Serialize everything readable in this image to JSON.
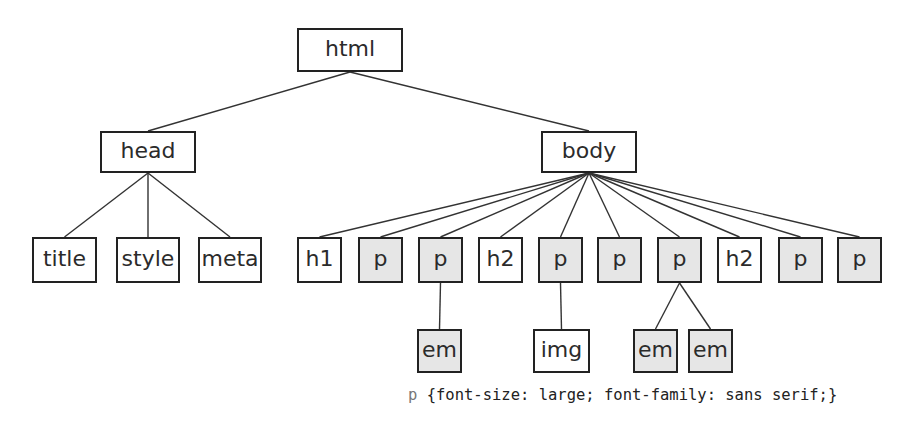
{
  "diagram": {
    "type": "dom-tree",
    "colors": {
      "border": "#222222",
      "edge": "#333333",
      "styled_fill": "#e6e6e6",
      "plain_fill": "#ffffff",
      "text": "#2b2b2b"
    },
    "nodes": [
      {
        "id": "html",
        "label": "html",
        "parent": null,
        "styled": false,
        "x": 297,
        "y": 28,
        "w": 106,
        "h": 44
      },
      {
        "id": "head",
        "label": "head",
        "parent": "html",
        "styled": false,
        "x": 100,
        "y": 131,
        "w": 96,
        "h": 42
      },
      {
        "id": "body",
        "label": "body",
        "parent": "html",
        "styled": false,
        "x": 541,
        "y": 131,
        "w": 96,
        "h": 42
      },
      {
        "id": "title",
        "label": "title",
        "parent": "head",
        "styled": false,
        "x": 32,
        "y": 237,
        "w": 65,
        "h": 46
      },
      {
        "id": "style",
        "label": "style",
        "parent": "head",
        "styled": false,
        "x": 116,
        "y": 237,
        "w": 64,
        "h": 46
      },
      {
        "id": "meta",
        "label": "meta",
        "parent": "head",
        "styled": false,
        "x": 198,
        "y": 237,
        "w": 64,
        "h": 46
      },
      {
        "id": "h1",
        "label": "h1",
        "parent": "body",
        "styled": false,
        "x": 297,
        "y": 237,
        "w": 45,
        "h": 46
      },
      {
        "id": "p1",
        "label": "p",
        "parent": "body",
        "styled": true,
        "x": 358,
        "y": 237,
        "w": 45,
        "h": 46
      },
      {
        "id": "p2",
        "label": "p",
        "parent": "body",
        "styled": true,
        "x": 418,
        "y": 237,
        "w": 45,
        "h": 46
      },
      {
        "id": "h2a",
        "label": "h2",
        "parent": "body",
        "styled": false,
        "x": 478,
        "y": 237,
        "w": 45,
        "h": 46
      },
      {
        "id": "p3",
        "label": "p",
        "parent": "body",
        "styled": true,
        "x": 538,
        "y": 237,
        "w": 45,
        "h": 46
      },
      {
        "id": "p4",
        "label": "p",
        "parent": "body",
        "styled": true,
        "x": 597,
        "y": 237,
        "w": 45,
        "h": 46
      },
      {
        "id": "p5",
        "label": "p",
        "parent": "body",
        "styled": true,
        "x": 657,
        "y": 237,
        "w": 45,
        "h": 46
      },
      {
        "id": "h2b",
        "label": "h2",
        "parent": "body",
        "styled": false,
        "x": 717,
        "y": 237,
        "w": 45,
        "h": 46
      },
      {
        "id": "p6",
        "label": "p",
        "parent": "body",
        "styled": true,
        "x": 778,
        "y": 237,
        "w": 45,
        "h": 46
      },
      {
        "id": "p7",
        "label": "p",
        "parent": "body",
        "styled": true,
        "x": 837,
        "y": 237,
        "w": 45,
        "h": 46
      },
      {
        "id": "em1",
        "label": "em",
        "parent": "p2",
        "styled": true,
        "x": 417,
        "y": 329,
        "w": 45,
        "h": 44
      },
      {
        "id": "img",
        "label": "img",
        "parent": "p3",
        "styled": false,
        "x": 533,
        "y": 329,
        "w": 57,
        "h": 44
      },
      {
        "id": "em2",
        "label": "em",
        "parent": "p5",
        "styled": true,
        "x": 633,
        "y": 329,
        "w": 45,
        "h": 44
      },
      {
        "id": "em3",
        "label": "em",
        "parent": "p5",
        "styled": true,
        "x": 688,
        "y": 329,
        "w": 45,
        "h": 44
      }
    ]
  },
  "css_rule": {
    "selector": "p",
    "declarations": " {font-size: large; font-family: sans serif;}"
  }
}
